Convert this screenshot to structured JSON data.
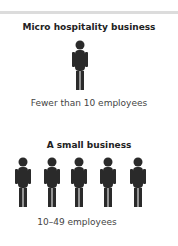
{
  "sections": [
    {
      "heading": "Micro hospitality business",
      "caption": "Fewer than 10 employees",
      "figure_count": 1
    },
    {
      "heading": "A small business",
      "caption": "10–49 employees",
      "figure_count": 5
    }
  ],
  "icons": {
    "figure": "person-icon"
  },
  "colors": {
    "figure": "#2a2a2a",
    "text": "#333333",
    "rule": "#dcdcdc"
  }
}
